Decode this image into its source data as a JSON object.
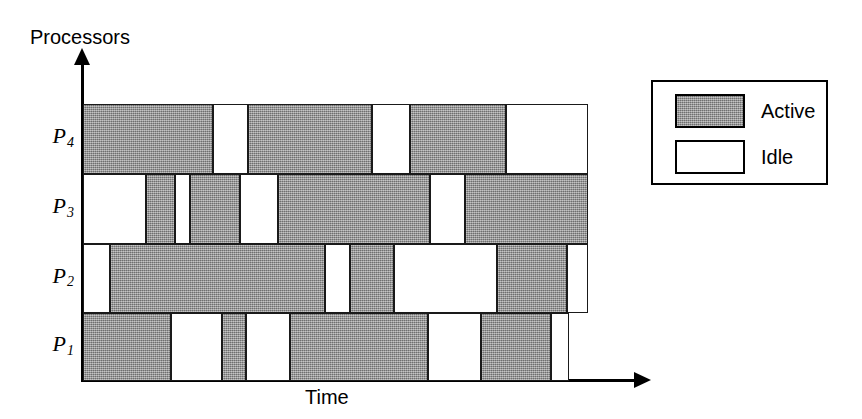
{
  "figure": {
    "y_axis_title": "Processors",
    "x_axis_title": "Time"
  },
  "legend": {
    "items": [
      {
        "label": "Active",
        "fill": "#8c8c8c",
        "state": "active"
      },
      {
        "label": "Idle",
        "fill": "#ffffff",
        "state": "idle"
      }
    ]
  },
  "chart_data": {
    "type": "bar",
    "title": "",
    "xlabel": "Time",
    "ylabel": "Processors",
    "grid": false,
    "legend_position": "right",
    "categories": [
      "P4",
      "P3",
      "P2",
      "P1"
    ],
    "category_labels": [
      {
        "base": "P",
        "sub": "4"
      },
      {
        "base": "P",
        "sub": "3"
      },
      {
        "base": "P",
        "sub": "2"
      },
      {
        "base": "P",
        "sub": "1"
      }
    ],
    "xlim": [
      0,
      100
    ],
    "value_labels": [
      "Active",
      "Idle"
    ],
    "colors": {
      "active": "#8c8c8c",
      "idle": "#ffffff",
      "border": "#1a1a1a"
    },
    "series": [
      {
        "name": "P4",
        "segments": [
          {
            "state": "active",
            "start": 0.0,
            "end": 25.7
          },
          {
            "state": "idle",
            "start": 25.7,
            "end": 32.7
          },
          {
            "state": "active",
            "start": 32.7,
            "end": 57.2
          },
          {
            "state": "idle",
            "start": 57.2,
            "end": 64.8
          },
          {
            "state": "active",
            "start": 64.8,
            "end": 83.8
          },
          {
            "state": "idle",
            "start": 83.8,
            "end": 100.0
          }
        ]
      },
      {
        "name": "P3",
        "segments": [
          {
            "state": "idle",
            "start": 0.0,
            "end": 12.5
          },
          {
            "state": "active",
            "start": 12.5,
            "end": 18.2
          },
          {
            "state": "idle",
            "start": 18.2,
            "end": 21.2
          },
          {
            "state": "active",
            "start": 21.2,
            "end": 31.1
          },
          {
            "state": "idle",
            "start": 31.1,
            "end": 38.6
          },
          {
            "state": "active",
            "start": 38.6,
            "end": 68.8
          },
          {
            "state": "idle",
            "start": 68.8,
            "end": 75.6
          },
          {
            "state": "active",
            "start": 75.6,
            "end": 100.0
          }
        ]
      },
      {
        "name": "P2",
        "segments": [
          {
            "state": "idle",
            "start": 0.0,
            "end": 5.3
          },
          {
            "state": "active",
            "start": 5.3,
            "end": 47.9
          },
          {
            "state": "idle",
            "start": 47.9,
            "end": 52.9
          },
          {
            "state": "active",
            "start": 52.9,
            "end": 61.6
          },
          {
            "state": "idle",
            "start": 61.6,
            "end": 82.0
          },
          {
            "state": "active",
            "start": 82.0,
            "end": 95.8
          },
          {
            "state": "idle",
            "start": 95.8,
            "end": 100.0
          }
        ]
      },
      {
        "name": "P1",
        "segments": [
          {
            "state": "active",
            "start": 0.0,
            "end": 17.4
          },
          {
            "state": "idle",
            "start": 17.4,
            "end": 27.5
          },
          {
            "state": "active",
            "start": 27.5,
            "end": 32.3
          },
          {
            "state": "idle",
            "start": 32.3,
            "end": 41.0
          },
          {
            "state": "active",
            "start": 41.0,
            "end": 68.3
          },
          {
            "state": "idle",
            "start": 68.3,
            "end": 78.9
          },
          {
            "state": "active",
            "start": 78.9,
            "end": 92.7
          },
          {
            "state": "idle",
            "start": 92.7,
            "end": 96.2
          }
        ]
      }
    ]
  }
}
